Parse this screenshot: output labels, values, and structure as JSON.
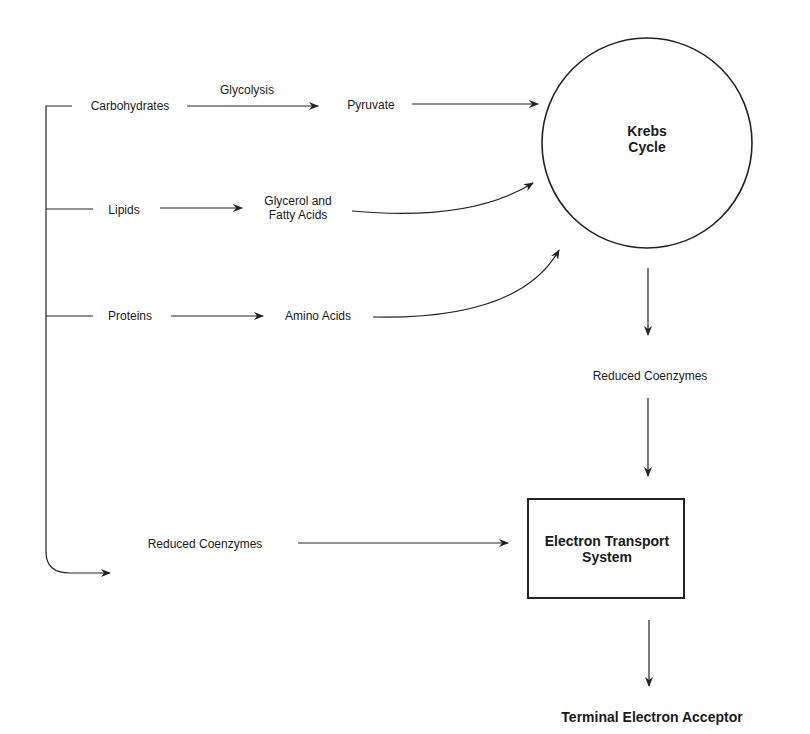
{
  "diagram": {
    "sources": {
      "carbohydrates": "Carbohydrates",
      "lipids": "Lipids",
      "proteins": "Proteins",
      "reduced_coenzymes_left": "Reduced Coenzymes"
    },
    "process_labels": {
      "glycolysis": "Glycolysis"
    },
    "intermediates": {
      "pyruvate": "Pyruvate",
      "glycerol_line1": "Glycerol and",
      "glycerol_line2": "Fatty Acids",
      "amino_acids": "Amino Acids",
      "reduced_coenzymes_mid": "Reduced Coenzymes"
    },
    "nodes": {
      "krebs_line1": "Krebs",
      "krebs_line2": "Cycle",
      "ets_line1": "Electron Transport",
      "ets_line2": "System",
      "terminal": "Terminal Electron Acceptor"
    },
    "colors": {
      "stroke": "#222222",
      "background": "#ffffff"
    }
  }
}
